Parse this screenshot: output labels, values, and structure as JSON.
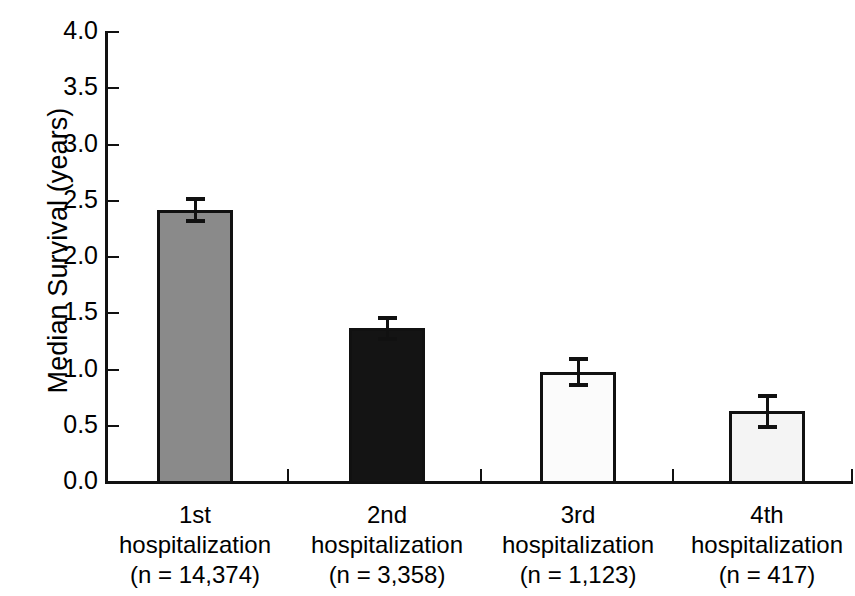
{
  "chart_data": {
    "type": "bar",
    "title": "",
    "xlabel": "",
    "ylabel": "Median Survival (years)",
    "ylim": [
      0.0,
      4.0
    ],
    "ytick_labels": [
      "0.0",
      "0.5",
      "1.0",
      "1.5",
      "2.0",
      "2.5",
      "3.0",
      "3.5",
      "4.0"
    ],
    "ytick_values": [
      0.0,
      0.5,
      1.0,
      1.5,
      2.0,
      2.5,
      3.0,
      3.5,
      4.0
    ],
    "grid": false,
    "legend": "none",
    "categories": [
      "1st hospitalization (n = 14,374)",
      "2nd hospitalization (n = 3,358)",
      "3rd hospitalization (n = 1,123)",
      "4th hospitalization (n = 417)"
    ],
    "values": [
      2.42,
      1.37,
      0.98,
      0.63
    ],
    "errors": [
      0.11,
      0.11,
      0.13,
      0.15
    ],
    "bar_colors": [
      "#8a8a8a",
      "#141414",
      "#fbfbfb",
      "#f4f4f4"
    ],
    "bar_edge_color": "#111111",
    "bars": [
      {
        "ordinal": "1st",
        "label_line2": "hospitalization",
        "label_line3": "(n = 14,374)",
        "n": "14,374",
        "value": 2.42,
        "error": 0.11,
        "fill": "#8a8a8a"
      },
      {
        "ordinal": "2nd",
        "label_line2": "hospitalization",
        "label_line3": "(n = 3,358)",
        "n": "3,358",
        "value": 1.37,
        "error": 0.11,
        "fill": "#141414"
      },
      {
        "ordinal": "3rd",
        "label_line2": "hospitalization",
        "label_line3": "(n = 1,123)",
        "n": "1,123",
        "value": 0.98,
        "error": 0.13,
        "fill": "#fbfbfb"
      },
      {
        "ordinal": "4th",
        "label_line2": "hospitalization",
        "label_line3": "(n = 417)",
        "n": "417",
        "value": 0.63,
        "error": 0.15,
        "fill": "#f4f4f4"
      }
    ]
  }
}
